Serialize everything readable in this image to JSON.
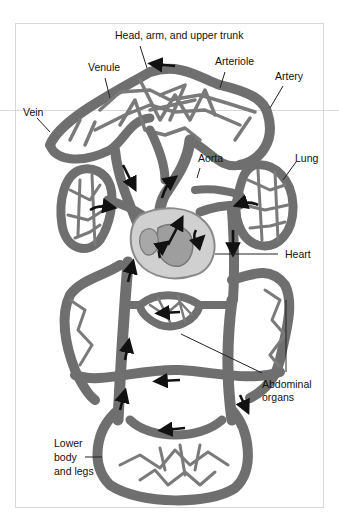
{
  "figure": {
    "colors": {
      "vessel": "#7d7d7d",
      "vessel_edge": "#5a5a5a",
      "vessel_highlight": "#a6a6a6",
      "heart": "#cfcfcf",
      "heart_inner": "#9a9a9a",
      "arrow": "#111111",
      "frame": "#d8d8d8",
      "background": "#ffffff"
    },
    "labels": {
      "head": "Head, arm, and upper trunk",
      "venule": "Venule",
      "arteriole": "Arteriole",
      "artery": "Artery",
      "vein": "Vein",
      "aorta": "Aorta",
      "lung": "Lung",
      "heart": "Heart",
      "abdominal_line1": "Abdominal",
      "abdominal_line2": "organs",
      "lower_line1": "Lower",
      "lower_line2": "body",
      "lower_line3": "and legs"
    }
  }
}
